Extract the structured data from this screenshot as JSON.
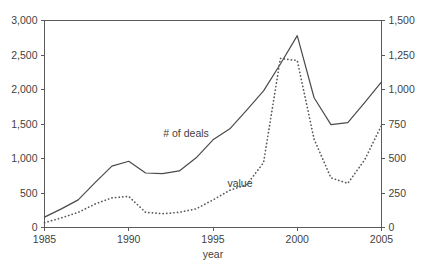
{
  "chart_data": {
    "type": "line",
    "title": "",
    "xlabel": "year",
    "ylabel": "",
    "grid": false,
    "legend_position": "inline-annotations",
    "x": [
      1985,
      1986,
      1987,
      1988,
      1989,
      1990,
      1991,
      1992,
      1993,
      1994,
      1995,
      1996,
      1997,
      1998,
      1999,
      2000,
      2001,
      2002,
      2003,
      2004,
      2005
    ],
    "xlim": [
      1985,
      2005
    ],
    "xticks": [
      1985,
      1990,
      1995,
      2000,
      2005
    ],
    "xtick_labels": [
      "1985",
      "1990",
      "1995",
      "2000",
      "2005"
    ],
    "left_axis": {
      "label": "",
      "ylim": [
        0,
        3000
      ],
      "yticks": [
        0,
        500,
        1000,
        1500,
        2000,
        2500,
        3000
      ],
      "ytick_labels": [
        "0",
        "500",
        "1,000",
        "1,500",
        "2,000",
        "2,500",
        "3,000"
      ]
    },
    "right_axis": {
      "label": "",
      "ylim": [
        0,
        1500
      ],
      "yticks": [
        0,
        250,
        500,
        750,
        1000,
        1250,
        1500
      ],
      "ytick_labels": [
        "0",
        "250",
        "500",
        "750",
        "1,000",
        "1,250",
        "1,500"
      ]
    },
    "series": [
      {
        "name": "# of deals",
        "axis": "left",
        "style": "solid",
        "color": "#4a4a4a",
        "values": [
          150,
          270,
          400,
          650,
          890,
          960,
          790,
          780,
          820,
          1010,
          1270,
          1430,
          1700,
          1980,
          2370,
          2780,
          1880,
          1490,
          1520,
          1810,
          2110
        ]
      },
      {
        "name": "value",
        "axis": "right",
        "style": "dotted",
        "color": "#5a5a5a",
        "values": [
          35,
          70,
          110,
          170,
          215,
          225,
          110,
          100,
          110,
          135,
          200,
          270,
          310,
          470,
          1225,
          1210,
          640,
          360,
          320,
          490,
          740
        ]
      }
    ],
    "annotations": [
      {
        "text": "# of deals",
        "x": 1993.4,
        "y_pixel": 137
      },
      {
        "text": "value",
        "x": 1996.6,
        "y_pixel": 187
      }
    ]
  },
  "axis_labels": {
    "x_title": "year"
  }
}
